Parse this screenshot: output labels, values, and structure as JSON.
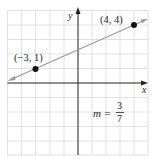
{
  "figure": {
    "x_axis_label": "x",
    "y_axis_label": "y",
    "points": [
      {
        "label": "(−3, 1)",
        "x": -3,
        "y": 1
      },
      {
        "label": "(4, 4)",
        "x": 4,
        "y": 4
      }
    ],
    "slope": {
      "prefix": "m =",
      "numerator": "3",
      "denominator": "7"
    },
    "grid": {
      "xmin": -5,
      "xmax": 5,
      "ymin": -5,
      "ymax": 5,
      "step": 1
    },
    "colors": {
      "grid": "#d9d9d9",
      "axes": "#231f20",
      "line": "#9a9a9a",
      "point": "#111111"
    }
  }
}
